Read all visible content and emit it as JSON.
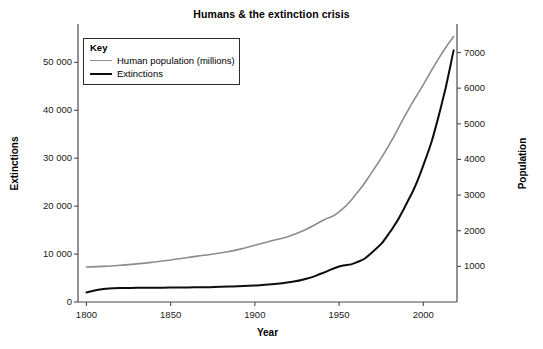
{
  "chart_data": {
    "type": "line",
    "title": "Humans & the extinction crisis",
    "xlabel": "Year",
    "ylabel": "Extinctions",
    "y2label": "Population",
    "xlim": [
      1795,
      2020
    ],
    "ylim": [
      0,
      58000
    ],
    "y2lim": [
      0,
      7800
    ],
    "grid": false,
    "legend_position": "top-left",
    "legend_title": "Key",
    "xticks": [
      1800,
      1850,
      1900,
      1950,
      2000
    ],
    "xtick_labels": [
      "1800",
      "1850",
      "1900",
      "1950",
      "2000"
    ],
    "yticks": [
      0,
      10000,
      20000,
      30000,
      40000,
      50000
    ],
    "ytick_labels": [
      "0",
      "10 000",
      "20 000",
      "30 000",
      "40 000",
      "50 000"
    ],
    "y2ticks": [
      1000,
      2000,
      3000,
      4000,
      5000,
      6000,
      7000
    ],
    "y2tick_labels": [
      "1000",
      "2000",
      "3000",
      "4000",
      "5000",
      "6000",
      "7000"
    ],
    "series": [
      {
        "name": "Human population (millions)",
        "axis": "right",
        "color": "#8c8c8c",
        "width": 1.6,
        "x": [
          1800,
          1810,
          1820,
          1830,
          1840,
          1850,
          1860,
          1870,
          1880,
          1890,
          1900,
          1910,
          1920,
          1930,
          1940,
          1950,
          1960,
          1970,
          1980,
          1990,
          2000,
          2010,
          2018
        ],
        "values": [
          980,
          1000,
          1030,
          1070,
          1120,
          1180,
          1250,
          1310,
          1380,
          1470,
          1590,
          1720,
          1840,
          2030,
          2280,
          2530,
          3020,
          3680,
          4430,
          5300,
          6100,
          6900,
          7450
        ]
      },
      {
        "name": "Extinctions",
        "axis": "left",
        "color": "#0d0d0d",
        "width": 2.0,
        "x": [
          1800,
          1810,
          1820,
          1830,
          1840,
          1850,
          1860,
          1870,
          1880,
          1890,
          1900,
          1910,
          1920,
          1930,
          1940,
          1950,
          1960,
          1970,
          1980,
          1990,
          2000,
          2010,
          2018
        ],
        "values": [
          2000,
          2700,
          2900,
          2950,
          2980,
          3000,
          3050,
          3100,
          3200,
          3300,
          3450,
          3700,
          4100,
          4800,
          6000,
          7400,
          8200,
          10500,
          14500,
          20500,
          28500,
          40000,
          52500
        ]
      }
    ]
  },
  "legend": {
    "title": "Key",
    "items": [
      {
        "label": "Human population (millions)",
        "color": "#8c8c8c"
      },
      {
        "label": "Extinctions",
        "color": "#0d0d0d"
      }
    ]
  }
}
